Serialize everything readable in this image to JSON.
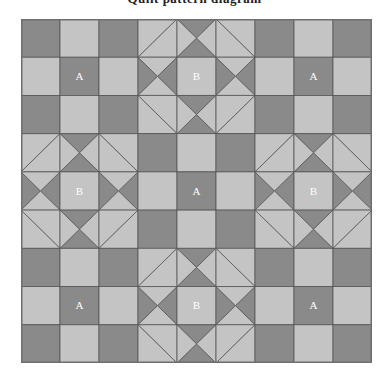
{
  "title": "Quilt pattern diagram",
  "colors": {
    "dark": "#8a8a8a",
    "light": "#c4c4c4",
    "line": "#555555",
    "outer_border": "#6f6f6f",
    "label_text": "#ffffff",
    "background": "#ffffff"
  },
  "quilt": {
    "grid_cols": 9,
    "grid_rows": 9,
    "block_cols": 3,
    "block_rows": 3,
    "cell_px": 39,
    "block_layout": [
      [
        "A",
        "B",
        "A"
      ],
      [
        "B",
        "A",
        "B"
      ],
      [
        "A",
        "B",
        "A"
      ]
    ],
    "labels": [
      {
        "text": "A",
        "block_row": 0,
        "block_col": 0
      },
      {
        "text": "B",
        "block_row": 0,
        "block_col": 1
      },
      {
        "text": "A",
        "block_row": 0,
        "block_col": 2
      },
      {
        "text": "B",
        "block_row": 1,
        "block_col": 0
      },
      {
        "text": "A",
        "block_row": 1,
        "block_col": 1
      },
      {
        "text": "B",
        "block_row": 1,
        "block_col": 2
      },
      {
        "text": "A",
        "block_row": 2,
        "block_col": 0
      },
      {
        "text": "B",
        "block_row": 2,
        "block_col": 1
      },
      {
        "text": "A",
        "block_row": 2,
        "block_col": 2
      }
    ],
    "block_defs": {
      "A": {
        "name": "nine-patch-checkerboard",
        "cells": [
          [
            "solid-dark",
            "solid-light",
            "solid-dark"
          ],
          [
            "solid-light",
            "solid-dark",
            "solid-light"
          ],
          [
            "solid-dark",
            "solid-light",
            "solid-dark"
          ]
        ]
      },
      "B": {
        "name": "card-trick-star",
        "cells": [
          [
            "hst-light-tr",
            "hourglass-v-dark",
            "hst-light-tl"
          ],
          [
            "hourglass-h-dark",
            "solid-light",
            "hourglass-h-dark"
          ],
          [
            "hst-light-br",
            "hourglass-v-dark",
            "hst-light-bl"
          ]
        ]
      }
    },
    "cell_types": {
      "solid-dark": "full dark square",
      "solid-light": "full light square",
      "hst-light-tr": "half-square triangle, light with diagonal seam bottom-left to top-right",
      "hst-light-tl": "half-square triangle, light with diagonal seam top-left to bottom-right",
      "hst-light-br": "half-square triangle, light with diagonal seam top-left to bottom-right",
      "hst-light-bl": "half-square triangle, light with diagonal seam bottom-left to top-right",
      "hourglass-v-dark": "quarter-square triangles: dark top and bottom, light left and right",
      "hourglass-h-dark": "quarter-square triangles: dark left and right, light top and bottom"
    }
  }
}
